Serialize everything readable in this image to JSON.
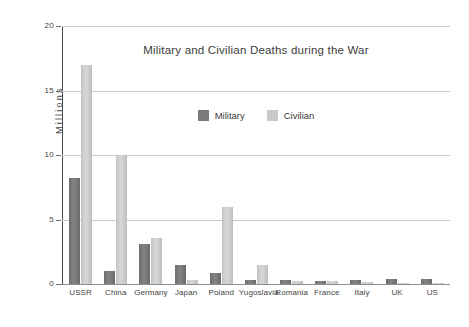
{
  "chart_data": {
    "type": "bar",
    "title": "Military and Civilian Deaths during the War",
    "xlabel": "",
    "ylabel": "Millions",
    "ylim": [
      0,
      20
    ],
    "yticks": [
      0,
      5,
      10,
      15,
      20
    ],
    "ytick_labels": [
      "0",
      "5",
      "10",
      "15",
      "20"
    ],
    "grid": true,
    "legend_position": "upper center",
    "categories": [
      "USSR",
      "China",
      "Germany",
      "Japan",
      "Poland",
      "Yugoslavia",
      "Romania",
      "France",
      "Italy",
      "UK",
      "US"
    ],
    "series": [
      {
        "name": "Military",
        "color": "#7a7a7a",
        "values": [
          8.2,
          1.0,
          3.1,
          1.5,
          0.85,
          0.3,
          0.3,
          0.25,
          0.35,
          0.4,
          0.4
        ]
      },
      {
        "name": "Civilian",
        "color": "#c9c9c9",
        "values": [
          17.0,
          10.0,
          3.6,
          0.3,
          6.0,
          1.5,
          0.2,
          0.2,
          0.15,
          0.1,
          0.05
        ]
      }
    ]
  },
  "legend": {
    "entries": [
      {
        "label": "Military"
      },
      {
        "label": "Civilian"
      }
    ]
  },
  "axes": {
    "y_title": "Millions"
  }
}
